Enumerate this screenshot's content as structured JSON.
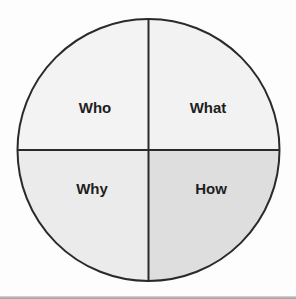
{
  "diagram": {
    "type": "quadrant-circle",
    "center": [
      148.5,
      150
    ],
    "radius": 131,
    "stroke_color": "#2a2a2a",
    "quadrants": [
      {
        "id": "top-left",
        "label": "Who",
        "fill": "#f3f3f3"
      },
      {
        "id": "top-right",
        "label": "What",
        "fill": "#f2f2f2"
      },
      {
        "id": "bottom-left",
        "label": "Why",
        "fill": "#ebebeb"
      },
      {
        "id": "bottom-right",
        "label": "How",
        "fill": "#dedede"
      }
    ]
  }
}
